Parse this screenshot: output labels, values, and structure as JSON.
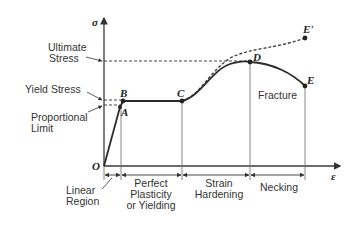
{
  "axes": {
    "y_symbol": "σ",
    "x_symbol": "ε",
    "origin_label": "O"
  },
  "stress_labels": {
    "ultimate_line1": "Ultimate",
    "ultimate_line2": "Stress",
    "yield": "Yield Stress",
    "proportional_line1": "Proportional",
    "proportional_line2": "Limit"
  },
  "points": {
    "A": "A",
    "B": "B",
    "C": "C",
    "D": "D",
    "E": "E",
    "E_prime": "E'"
  },
  "annotations": {
    "fracture": "Fracture"
  },
  "regions": {
    "linear_line1": "Linear",
    "linear_line2": "Region",
    "plastic_line1": "Perfect",
    "plastic_line2": "Plasticity",
    "plastic_line3": "or Yielding",
    "hardening_line1": "Strain",
    "hardening_line2": "Hardening",
    "necking": "Necking"
  },
  "colors": {
    "curve": "#2b2b2b",
    "dashed": "#444444",
    "axis": "#3a3a3a",
    "guide": "#777777",
    "text": "#333333"
  }
}
